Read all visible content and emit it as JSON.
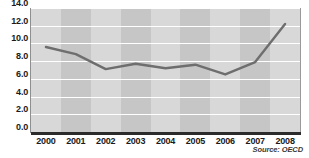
{
  "chart_data": {
    "type": "line",
    "title": "",
    "subtitle": "",
    "xlabel": "",
    "ylabel": "",
    "categories": [
      "2000",
      "2001",
      "2002",
      "2003",
      "2004",
      "2005",
      "2006",
      "2007",
      "2008"
    ],
    "values": [
      9.6,
      8.8,
      7.1,
      7.7,
      7.2,
      7.6,
      6.5,
      7.9,
      12.2
    ],
    "series": [
      {
        "name": "",
        "values": [
          9.6,
          8.8,
          7.1,
          7.7,
          7.2,
          7.6,
          6.5,
          7.9,
          12.2
        ]
      }
    ],
    "ylim": [
      0.0,
      14.0
    ],
    "ytick_step": 2.0,
    "ytick_labels": [
      "14.0",
      "12.0",
      "10.0",
      "8.0",
      "6.0",
      "4.0",
      "2.0",
      "0.0"
    ],
    "ytick_values": [
      14.0,
      12.0,
      10.0,
      8.0,
      6.0,
      4.0,
      2.0,
      0.0
    ],
    "xtick_labels": [
      "2000",
      "2001",
      "2002",
      "2003",
      "2004",
      "2005",
      "2006",
      "2007",
      "2008"
    ],
    "grid": "horizontal-white-gridlines",
    "grid_on": true,
    "legend": "none",
    "legend_position": "none",
    "annotations": {
      "source": "Source: OECD"
    },
    "colors": {
      "line": "#6e6e6e",
      "plot_band_light": "#d8d8d8",
      "plot_band_dark": "#c6c6c6",
      "gridline": "#ffffff",
      "axis": "#2b2b2b",
      "text": "#1a1a1a"
    }
  }
}
